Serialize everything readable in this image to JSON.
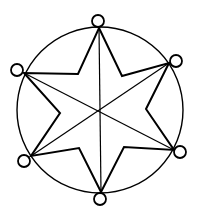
{
  "diagram": {
    "type": "six-pointed star inscribed in circle with nodes",
    "stroke_color": "#000000",
    "background": "#ffffff",
    "outer_circle": {
      "cx": 100,
      "cy": 110,
      "r": 83
    },
    "center": {
      "x": 100,
      "y": 111
    },
    "nodes": [
      {
        "id": "top",
        "cx": 98,
        "cy": 21,
        "r": 6
      },
      {
        "id": "upper-right",
        "cx": 176,
        "cy": 61,
        "r": 6
      },
      {
        "id": "lower-right",
        "cx": 180,
        "cy": 152,
        "r": 6
      },
      {
        "id": "bottom",
        "cx": 100,
        "cy": 199,
        "r": 6
      },
      {
        "id": "lower-left",
        "cx": 24,
        "cy": 161,
        "r": 6
      },
      {
        "id": "upper-left",
        "cx": 17,
        "cy": 70,
        "r": 6
      }
    ],
    "star_points": [
      {
        "x": 99,
        "y": 28
      },
      {
        "x": 122,
        "y": 76
      },
      {
        "x": 169,
        "y": 63
      },
      {
        "x": 146,
        "y": 109
      },
      {
        "x": 174,
        "y": 150
      },
      {
        "x": 124,
        "y": 147
      },
      {
        "x": 101,
        "y": 192
      },
      {
        "x": 79,
        "y": 148
      },
      {
        "x": 31,
        "y": 156
      },
      {
        "x": 60,
        "y": 113
      },
      {
        "x": 24,
        "y": 73
      },
      {
        "x": 78,
        "y": 74
      }
    ],
    "diagonals": [
      {
        "from": "top",
        "to": "bottom",
        "x1": 99,
        "y1": 28,
        "x2": 101,
        "y2": 192
      },
      {
        "from": "upper-left",
        "to": "lower-right",
        "x1": 24,
        "y1": 73,
        "x2": 174,
        "y2": 150
      },
      {
        "from": "upper-right",
        "to": "lower-left",
        "x1": 169,
        "y1": 63,
        "x2": 31,
        "y2": 156
      }
    ]
  }
}
